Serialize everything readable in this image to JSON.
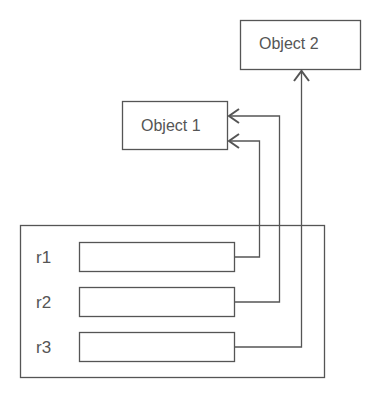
{
  "diagram": {
    "objects": [
      {
        "id": "object1",
        "label": "Object 1"
      },
      {
        "id": "object2",
        "label": "Object 2"
      }
    ],
    "container": {
      "rows": [
        {
          "label": "r1",
          "points_to": "Object 1"
        },
        {
          "label": "r2",
          "points_to": "Object 1"
        },
        {
          "label": "r3",
          "points_to": "Object 2"
        }
      ]
    },
    "colors": {
      "stroke": "#555555",
      "text": "#555555",
      "background": "#ffffff"
    }
  }
}
